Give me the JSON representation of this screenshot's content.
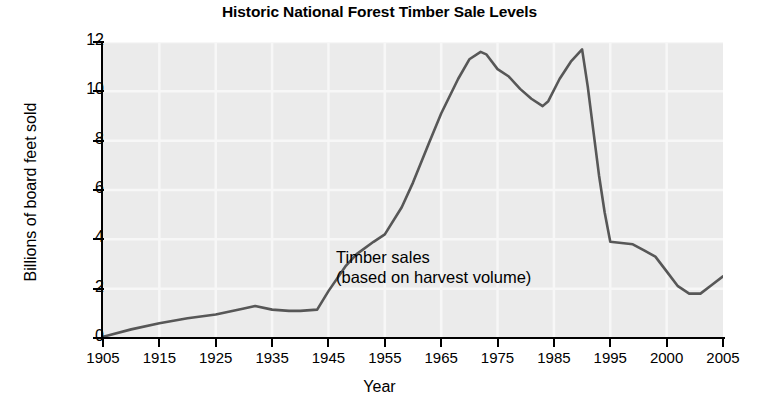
{
  "chart_data": {
    "type": "line",
    "title": "Historic National Forest Timber Sale Levels",
    "xlabel": "Year",
    "ylabel": "Billions of board feet sold",
    "grid": true,
    "legend": "none",
    "xlim": [
      1905,
      2005
    ],
    "ylim": [
      0,
      12
    ],
    "xticks": [
      "1905",
      "1915",
      "1925",
      "1935",
      "1945",
      "1955",
      "1965",
      "1975",
      "1985",
      "1995",
      "2000",
      "2005"
    ],
    "yticks": [
      "0",
      "2",
      "4",
      "6",
      "8",
      "10",
      "12"
    ],
    "annotations": [
      {
        "text_line1": "Timber sales",
        "text_line2": "(based on harvest volume)"
      }
    ],
    "series": [
      {
        "name": "Timber sales (based on harvest volume)",
        "color": "#575757",
        "x": [
          1905,
          1910,
          1915,
          1920,
          1925,
          1930,
          1932,
          1935,
          1938,
          1940,
          1943,
          1945,
          1948,
          1950,
          1953,
          1955,
          1958,
          1960,
          1963,
          1965,
          1968,
          1970,
          1972,
          1973,
          1975,
          1977,
          1979,
          1981,
          1983,
          1984,
          1986,
          1988,
          1990,
          1991,
          1992,
          1993,
          1994,
          1995,
          1996,
          1997,
          1998,
          1999,
          2000,
          2001,
          2002,
          2003,
          2004,
          2005
        ],
        "y": [
          0.05,
          0.35,
          0.6,
          0.8,
          0.95,
          1.2,
          1.3,
          1.15,
          1.1,
          1.1,
          1.15,
          1.9,
          2.9,
          3.4,
          3.9,
          4.2,
          5.3,
          6.3,
          8.0,
          9.1,
          10.5,
          11.3,
          11.6,
          11.5,
          10.9,
          10.6,
          10.1,
          9.7,
          9.4,
          9.6,
          10.5,
          11.2,
          11.7,
          10.2,
          8.4,
          6.6,
          5.1,
          3.9,
          3.85,
          3.8,
          3.55,
          3.3,
          2.7,
          2.1,
          1.8,
          1.8,
          2.15,
          2.5
        ]
      }
    ]
  },
  "axis": {
    "ytick_positions": [
      0,
      2,
      4,
      6,
      8,
      10,
      12
    ]
  }
}
